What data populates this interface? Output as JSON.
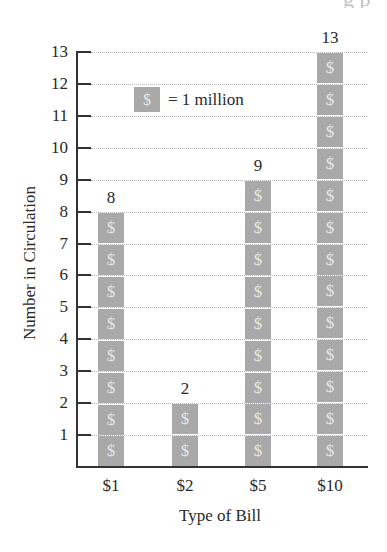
{
  "chart_data": {
    "type": "bar",
    "title": "",
    "categories": [
      "$1",
      "$2",
      "$5",
      "$10"
    ],
    "values": [
      8,
      2,
      9,
      13
    ],
    "xlabel": "Type of Bill",
    "ylabel": "Number in Circulation",
    "ylim": [
      0,
      13
    ],
    "yticks": [
      1,
      2,
      3,
      4,
      5,
      6,
      7,
      8,
      9,
      10,
      11,
      12,
      13
    ],
    "grid": true,
    "legend": {
      "symbol": "$",
      "text": "= 1 million",
      "position": "upper-left"
    },
    "data_labels": [
      "8",
      "2",
      "9",
      "13"
    ],
    "pictograph": true,
    "units": "millions"
  },
  "colors": {
    "tile": "#a9a9a9",
    "tile_symbol": "#e6e6e6",
    "axis": "#333333",
    "grid": "#b5b5b5",
    "text": "#2a2a2a"
  },
  "icons": {
    "tile_symbol": "$"
  },
  "cropped_header": "g p"
}
